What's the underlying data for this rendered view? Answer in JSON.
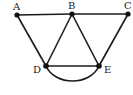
{
  "diagram": {
    "type": "graph",
    "nodes": [
      {
        "id": "A",
        "label": "A"
      },
      {
        "id": "B",
        "label": "B"
      },
      {
        "id": "C",
        "label": "C"
      },
      {
        "id": "D",
        "label": "D"
      },
      {
        "id": "E",
        "label": "E"
      }
    ],
    "edges": [
      {
        "from": "A",
        "to": "B"
      },
      {
        "from": "B",
        "to": "C"
      },
      {
        "from": "A",
        "to": "D"
      },
      {
        "from": "B",
        "to": "D"
      },
      {
        "from": "B",
        "to": "E"
      },
      {
        "from": "C",
        "to": "E"
      },
      {
        "from": "D",
        "to": "E",
        "style": "straight"
      },
      {
        "from": "D",
        "to": "E",
        "style": "curved"
      }
    ]
  }
}
